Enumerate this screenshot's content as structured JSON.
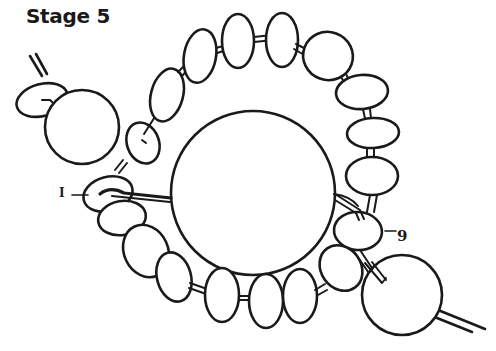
{
  "title": "Stage 5",
  "labels": {
    "start": "I",
    "end": "9"
  },
  "colors": {
    "ink": "#1a1a1a",
    "background": "#ffffff"
  },
  "diagram": {
    "large_beads": [
      {
        "name": "top-left-large-bead",
        "cx": 82,
        "cy": 127,
        "r": 37
      },
      {
        "name": "center-large-bead",
        "cx": 253,
        "cy": 193,
        "r": 82
      },
      {
        "name": "bottom-right-large-bead",
        "cx": 402,
        "cy": 295,
        "r": 40
      }
    ]
  }
}
